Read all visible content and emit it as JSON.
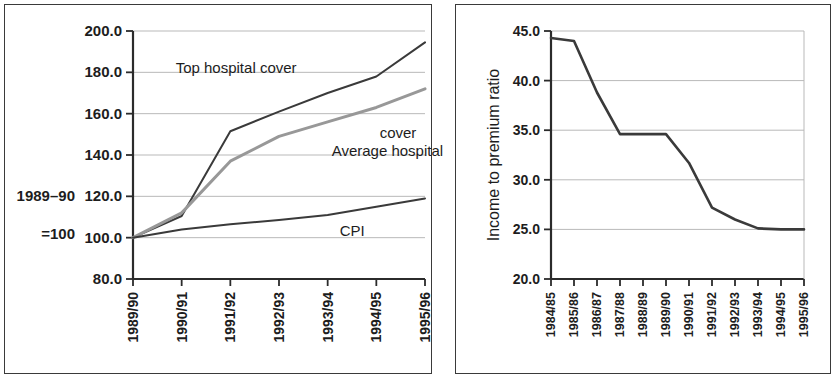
{
  "figure": {
    "panel_count": 2,
    "background_color": "#ffffff",
    "frame_color": "#3a3a3a"
  },
  "left_panel": {
    "y_axis_note_line1": "1989–90",
    "y_axis_note_line2": "=100"
  },
  "right_panel": {
    "y_axis_title": "Income to premium ratio"
  },
  "chart_data": [
    {
      "type": "line",
      "title": "",
      "xlabel": "",
      "ylabel": "1989–90 =100",
      "categories": [
        "1989/90",
        "1990/91",
        "1991/92",
        "1992/93",
        "1993/94",
        "1994/95",
        "1995/96"
      ],
      "ylim": [
        80.0,
        200.0
      ],
      "yticks": [
        80.0,
        100.0,
        120.0,
        140.0,
        160.0,
        180.0,
        200.0
      ],
      "ytick_labels": [
        "80.0",
        "100.0",
        "120.0",
        "140.0",
        "160.0",
        "180.0",
        "200.0"
      ],
      "grid": true,
      "legend": "inline-annotations",
      "series": [
        {
          "name": "Top hospital cover",
          "color": "#3a3a3a",
          "values": [
            100.0,
            110.5,
            151.5,
            161.0,
            170.0,
            178.0,
            194.5
          ],
          "label_x": "1990/91",
          "label_y": 182.0
        },
        {
          "name": "Average hospital cover",
          "color": "#989898",
          "values": [
            100.0,
            112.0,
            137.0,
            149.0,
            156.0,
            163.0,
            172.0
          ],
          "label_x": "1993/94",
          "label_y": 142.0
        },
        {
          "name": "CPI",
          "color": "#3a3a3a",
          "values": [
            100.0,
            104.0,
            106.5,
            108.5,
            111.0,
            115.0,
            119.0
          ],
          "label_x": "1993/94",
          "label_y": 103.0
        }
      ],
      "annotations": [
        {
          "text": "Top hospital cover",
          "series": "Top hospital cover"
        },
        {
          "text": "Average hospital",
          "series": "Average hospital cover"
        },
        {
          "text": "cover",
          "series": "Average hospital cover"
        },
        {
          "text": "CPI",
          "series": "CPI"
        }
      ]
    },
    {
      "type": "line",
      "title": "",
      "xlabel": "",
      "ylabel": "Income to premium ratio",
      "categories": [
        "1984/85",
        "1985/86",
        "1986/87",
        "1987/88",
        "1988/89",
        "1989/90",
        "1990/91",
        "1991/92",
        "1992/93",
        "1993/94",
        "1994/95",
        "1995/96"
      ],
      "ylim": [
        20.0,
        45.0
      ],
      "yticks": [
        20.0,
        25.0,
        30.0,
        35.0,
        40.0,
        45.0
      ],
      "ytick_labels": [
        "20.0",
        "25.0",
        "30.0",
        "35.0",
        "40.0",
        "45.0"
      ],
      "grid": true,
      "legend": "none",
      "series": [
        {
          "name": "Income to premium ratio",
          "color": "#3a3a3a",
          "values": [
            44.3,
            44.0,
            38.8,
            34.6,
            34.6,
            34.6,
            31.7,
            27.2,
            26.0,
            25.1,
            25.0,
            25.0
          ]
        }
      ]
    }
  ]
}
